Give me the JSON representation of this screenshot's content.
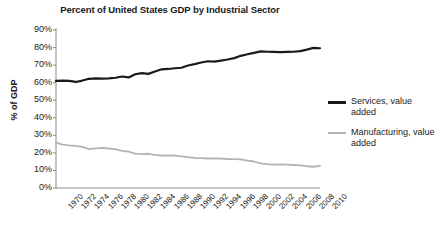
{
  "chart_data": {
    "type": "line",
    "title": "Percent of United States GDP by Industrial Sector",
    "xlabel": "",
    "ylabel": "% of GDP",
    "ylim": [
      0,
      90
    ],
    "yticks": [
      "0%",
      "10%",
      "20%",
      "30%",
      "40%",
      "50%",
      "60%",
      "70%",
      "80%",
      "90%"
    ],
    "ytick_values": [
      0,
      10,
      20,
      30,
      40,
      50,
      60,
      70,
      80,
      90
    ],
    "xlim": [
      1970,
      2010
    ],
    "xticks": [
      "1970",
      "1972",
      "1974",
      "1976",
      "1978",
      "1980",
      "1982",
      "1984",
      "1986",
      "1988",
      "1990",
      "1992",
      "1994",
      "1996",
      "1998",
      "2000",
      "2002",
      "2004",
      "2006",
      "2008",
      "2010"
    ],
    "x": [
      1970,
      1971,
      1972,
      1973,
      1974,
      1975,
      1976,
      1977,
      1978,
      1979,
      1980,
      1981,
      1982,
      1983,
      1984,
      1985,
      1986,
      1987,
      1988,
      1989,
      1990,
      1991,
      1992,
      1993,
      1994,
      1995,
      1996,
      1997,
      1998,
      1999,
      2000,
      2001,
      2002,
      2003,
      2004,
      2005,
      2006,
      2007,
      2008,
      2009,
      2010
    ],
    "grid": false,
    "legend_position": "right",
    "series": [
      {
        "name": "Services, value added",
        "color": "#1a1a1a",
        "values": [
          61.0,
          61.2,
          61.0,
          60.4,
          61.2,
          62.2,
          62.4,
          62.3,
          62.4,
          62.8,
          63.5,
          63.0,
          64.8,
          65.4,
          65.0,
          66.4,
          67.6,
          67.8,
          68.2,
          68.5,
          69.8,
          70.6,
          71.5,
          72.2,
          72.0,
          72.6,
          73.2,
          74.0,
          75.3,
          76.2,
          77.0,
          77.8,
          77.6,
          77.5,
          77.4,
          77.5,
          77.6,
          78.0,
          78.8,
          79.8,
          79.6
        ]
      },
      {
        "name": "Manufacturing, value added",
        "color": "#b3b3b3",
        "values": [
          25.8,
          24.7,
          24.3,
          24.0,
          23.4,
          22.2,
          22.6,
          22.8,
          22.5,
          22.2,
          21.2,
          20.7,
          19.6,
          19.3,
          19.5,
          18.9,
          18.5,
          18.4,
          18.5,
          18.0,
          17.6,
          17.1,
          17.0,
          16.8,
          16.9,
          16.8,
          16.4,
          16.5,
          16.3,
          15.6,
          15.1,
          14.0,
          13.6,
          13.3,
          13.4,
          13.3,
          13.1,
          12.9,
          12.4,
          12.1,
          12.6
        ]
      }
    ]
  }
}
